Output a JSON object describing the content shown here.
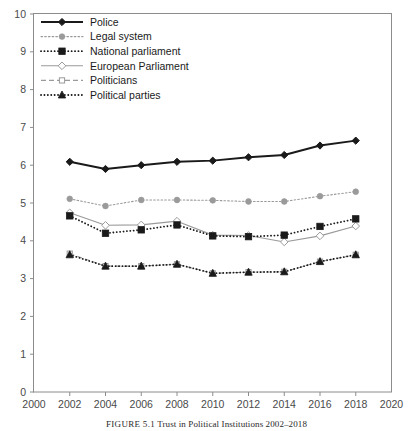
{
  "caption": {
    "figure_number": "FIGURE 5.1",
    "text": "Trust in Political Institutions 2002–2018"
  },
  "chart_data": {
    "type": "line",
    "title": "",
    "subtitle": "",
    "xlabel": "",
    "ylabel": "",
    "xlim": [
      2000,
      2020
    ],
    "ylim": [
      0,
      10
    ],
    "grid": false,
    "legend_position": "top-left",
    "x_ticks": [
      2000,
      2002,
      2004,
      2006,
      2008,
      2010,
      2012,
      2014,
      2016,
      2018,
      2020
    ],
    "y_ticks": [
      0,
      1,
      2,
      3,
      4,
      5,
      6,
      7,
      8,
      9,
      10
    ],
    "x": [
      2002,
      2004,
      2006,
      2008,
      2010,
      2012,
      2014,
      2016,
      2018
    ],
    "series": [
      {
        "name": "Police",
        "marker": "filled-diamond",
        "line_style": "solid",
        "color": "#1a1a1a",
        "values": [
          6.09,
          5.9,
          6.0,
          6.09,
          6.12,
          6.21,
          6.27,
          6.52,
          6.65
        ]
      },
      {
        "name": "Legal system",
        "marker": "filled-circle",
        "line_style": "dotted",
        "color": "#9a9a9a",
        "values": [
          5.11,
          4.92,
          5.08,
          5.08,
          5.07,
          5.04,
          5.04,
          5.18,
          5.3
        ]
      },
      {
        "name": "National parliament",
        "marker": "filled-square",
        "line_style": "dotted",
        "color": "#1a1a1a",
        "values": [
          4.66,
          4.2,
          4.29,
          4.42,
          4.13,
          4.11,
          4.15,
          4.38,
          4.58
        ]
      },
      {
        "name": "European Parliament",
        "marker": "open-diamond",
        "line_style": "solid",
        "color": "#9a9a9a",
        "values": [
          4.74,
          4.41,
          4.42,
          4.52,
          4.15,
          4.14,
          3.97,
          4.13,
          4.39
        ]
      },
      {
        "name": "Politicians",
        "marker": "open-square",
        "line_style": "dashed",
        "color": "#9a9a9a",
        "values": [
          3.66,
          3.33,
          3.33,
          3.38,
          3.14,
          3.17,
          3.18,
          3.45,
          3.63
        ]
      },
      {
        "name": "Political parties",
        "marker": "filled-triangle",
        "line_style": "dotted",
        "color": "#1a1a1a",
        "values": [
          3.63,
          3.33,
          3.33,
          3.38,
          3.14,
          3.17,
          3.18,
          3.45,
          3.63
        ]
      }
    ]
  },
  "legend": {
    "items": [
      {
        "label": "Police"
      },
      {
        "label": "Legal system"
      },
      {
        "label": "National parliament"
      },
      {
        "label": "European Parliament"
      },
      {
        "label": "Politicians"
      },
      {
        "label": "Political parties"
      }
    ]
  },
  "axes": {
    "y_labels": [
      "10",
      "9",
      "8",
      "7",
      "6",
      "5",
      "4",
      "3",
      "2",
      "1",
      "0"
    ],
    "x_labels": [
      "2000",
      "2002",
      "2004",
      "2006",
      "2008",
      "2010",
      "2012",
      "2014",
      "2016",
      "2018",
      "2020"
    ]
  },
  "colors": {
    "dark": "#1a1a1a",
    "gray": "#9a9a9a",
    "frame": "#8c8c8c",
    "tick_text": "#4a4a4a",
    "background": "#ffffff"
  }
}
